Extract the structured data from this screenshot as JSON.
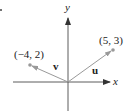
{
  "diagram": {
    "axes": {
      "x_label": "x",
      "y_label": "y"
    },
    "bullet": "•",
    "vectors": [
      {
        "name": "u",
        "label": "u",
        "endpoint": [
          5,
          3
        ],
        "endpoint_label": "(5, 3)"
      },
      {
        "name": "v",
        "label": "v",
        "endpoint": [
          -4,
          2
        ],
        "endpoint_label": "(−4, 2)"
      }
    ],
    "colors": {
      "axis": "#333333",
      "vector": "#999999",
      "point": "#999999",
      "text": "#222222"
    }
  }
}
